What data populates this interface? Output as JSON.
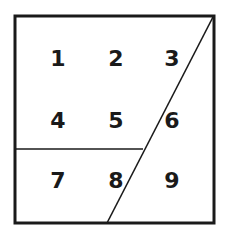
{
  "diagram": {
    "colors": {
      "background": "#ffffff",
      "stroke": "#1a1a1a",
      "text": "#1a1a1a"
    },
    "outer_square": {
      "x": 15,
      "y": 16,
      "width": 199,
      "height": 207,
      "stroke_width": 3
    },
    "lines": [
      {
        "name": "diagonal-line",
        "x1": 213,
        "y1": 17,
        "x2": 107,
        "y2": 223,
        "stroke_width": 1.6
      },
      {
        "name": "horizontal-line",
        "x1": 15,
        "y1": 149,
        "x2": 143,
        "y2": 149,
        "stroke_width": 1.6
      }
    ],
    "labels": [
      {
        "text": "1",
        "x": 58,
        "y": 58
      },
      {
        "text": "2",
        "x": 116,
        "y": 58
      },
      {
        "text": "3",
        "x": 172,
        "y": 58
      },
      {
        "text": "4",
        "x": 58,
        "y": 120
      },
      {
        "text": "5",
        "x": 116,
        "y": 120
      },
      {
        "text": "6",
        "x": 172,
        "y": 120
      },
      {
        "text": "7",
        "x": 58,
        "y": 180
      },
      {
        "text": "8",
        "x": 116,
        "y": 180
      },
      {
        "text": "9",
        "x": 172,
        "y": 180
      }
    ]
  }
}
